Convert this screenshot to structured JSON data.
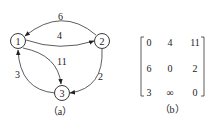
{
  "graph": {
    "caption": "（a）",
    "nodes": [
      {
        "id": "1",
        "label": "1"
      },
      {
        "id": "2",
        "label": "2"
      },
      {
        "id": "3",
        "label": "3"
      }
    ],
    "edges": [
      {
        "from": "2",
        "to": "1",
        "weight": "6"
      },
      {
        "from": "1",
        "to": "2",
        "weight": "4"
      },
      {
        "from": "1",
        "to": "3",
        "weight": "11"
      },
      {
        "from": "3",
        "to": "1",
        "weight": "3"
      },
      {
        "from": "2",
        "to": "3",
        "weight": "2"
      }
    ]
  },
  "matrix": {
    "caption": "（b）",
    "rows": [
      [
        "0",
        "4",
        "11"
      ],
      [
        "6",
        "0",
        "2"
      ],
      [
        "3",
        "∞",
        "0"
      ]
    ]
  }
}
